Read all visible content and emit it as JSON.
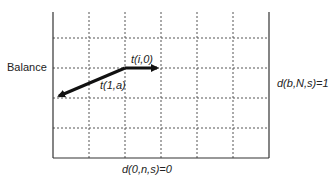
{
  "diagram": {
    "y_axis_label": "Balance",
    "right_label": "d(b,N,s)=1",
    "bottom_label": "d(0,n,s)=0",
    "arrows": [
      {
        "label": "t(i,0)",
        "from": [
          125,
          68
        ],
        "to": [
          161,
          68
        ]
      },
      {
        "label": "t(1,a)",
        "from": [
          125,
          68
        ],
        "to": [
          55,
          98
        ]
      }
    ],
    "grid": {
      "left": 53,
      "right": 269,
      "top": 12,
      "bottom": 158,
      "vertical_dashed": [
        89,
        125,
        161,
        197,
        233
      ],
      "horizontal_dashed": [
        38,
        68,
        98,
        128
      ]
    },
    "colors": {
      "line": "#333333",
      "grid": "#555555",
      "arrow": "#111111"
    }
  }
}
